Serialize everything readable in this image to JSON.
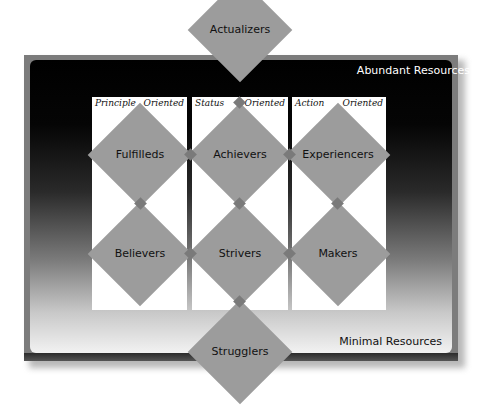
{
  "diagram": {
    "resource_labels": {
      "top": "Abundant Resources",
      "bottom": "Minimal Resources"
    },
    "columns": [
      {
        "left": "Principle",
        "right": "Oriented"
      },
      {
        "left": "Status",
        "right": "Oriented"
      },
      {
        "left": "Action",
        "right": "Oriented"
      }
    ],
    "segments": {
      "top": "Actualizers",
      "row1": [
        "Fulfilleds",
        "Achievers",
        "Experiencers"
      ],
      "row2": [
        "Believers",
        "Strivers",
        "Makers"
      ],
      "bottom": "Strugglers"
    },
    "colors": {
      "diamond_fill": "#9c9c9c",
      "connector_fill": "#7a7a7a",
      "frame_border": "#7c7c7c",
      "gradient_top": "#000000",
      "gradient_bottom": "#f2f2f2",
      "panel_fill": "#ffffff"
    }
  }
}
